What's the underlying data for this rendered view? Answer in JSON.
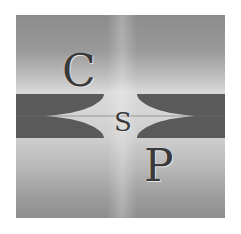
{
  "logo": {
    "letters": {
      "top": "C",
      "middle": "S",
      "bottom": "P"
    },
    "colors": {
      "band": "#5a5a5a",
      "background_dark": "#8c8c8c",
      "background_light": "#dadada",
      "letter": "#3a3a3a"
    }
  }
}
